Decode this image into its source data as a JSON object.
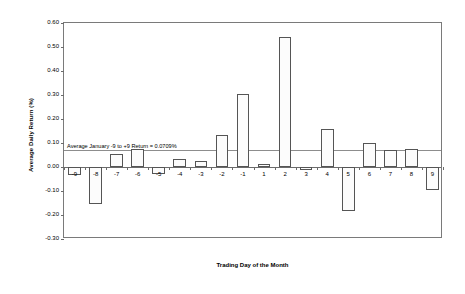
{
  "chart_data": {
    "type": "bar",
    "title": "",
    "xlabel": "Trading Day of the Month",
    "ylabel": "Average Daily Return (%)",
    "ylim": [
      -0.3,
      0.6
    ],
    "ytick_labels": [
      "0.60",
      "0.50",
      "0.40",
      "0.30",
      "0.20",
      "0.10",
      "0.00",
      "-0.10",
      "-0.20",
      "-0.30"
    ],
    "ytick_values": [
      0.6,
      0.5,
      0.4,
      0.3,
      0.2,
      0.1,
      0.0,
      -0.1,
      -0.2,
      -0.3
    ],
    "grid": false,
    "legend": "none",
    "categories": [
      "-9",
      "-8",
      "-7",
      "-6",
      "-5",
      "-4",
      "-3",
      "-2",
      "-1",
      "1",
      "2",
      "3",
      "4",
      "5",
      "6",
      "7",
      "8",
      "9"
    ],
    "values": [
      -0.035,
      -0.155,
      0.055,
      0.075,
      -0.03,
      0.035,
      0.025,
      0.135,
      0.305,
      0.012,
      0.54,
      -0.012,
      0.16,
      -0.185,
      0.1,
      0.07,
      0.075,
      -0.095
    ],
    "annotations": [
      {
        "name": "average-return-reference-line",
        "text": "Average January -9 to +9 Return = 0.0709%",
        "value": 0.0709
      }
    ]
  }
}
